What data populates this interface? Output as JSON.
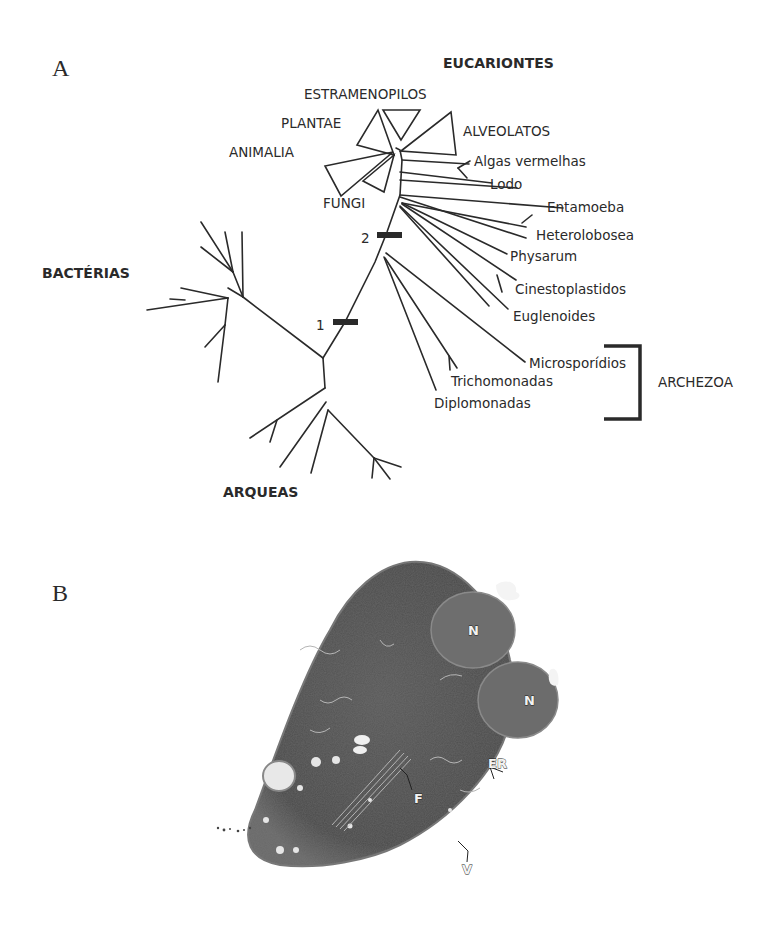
{
  "figure": {
    "panel_a": {
      "label": "A",
      "domains": {
        "eukaryotes": "EUCARIONTES",
        "bacteria": "BACTÉRIAS",
        "archaea": "ARQUEAS"
      },
      "collapsed_clades": [
        "ESTRAMENOPILOS",
        "PLANTAE",
        "ANIMALIA",
        "FUNGI",
        "ALVEOLATOS"
      ],
      "taxa": [
        "Algas vermelhas",
        "Lodo",
        "Entamoeba",
        "Heterolobosea",
        "Physarum",
        "Cinestoplastidos",
        "Euglenoides",
        "Microsporídios",
        "Trichomonadas",
        "Diplomonadas"
      ],
      "markers": [
        "1",
        "2"
      ],
      "bracket_label": "ARCHEZOA"
    },
    "panel_b": {
      "label": "B",
      "annotations": [
        "N",
        "N",
        "ER",
        "F",
        "V"
      ]
    }
  }
}
